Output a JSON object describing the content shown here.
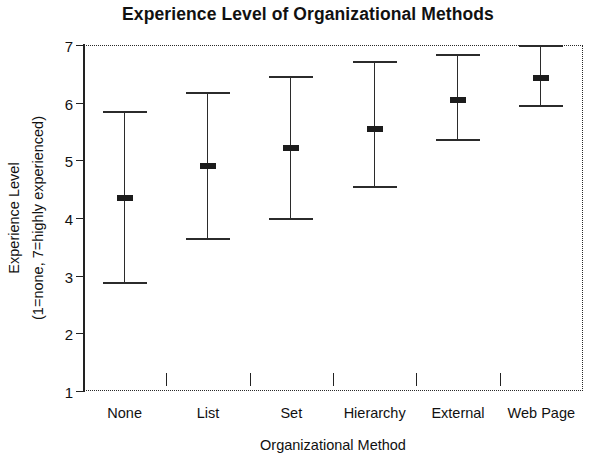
{
  "chart_data": {
    "type": "errorbar",
    "title": "Experience Level of Organizational Methods",
    "xlabel": "Organizational Method",
    "ylabel_line1": "Experience Level",
    "ylabel_line2": "(1=none, 7=highly experienced)",
    "categories": [
      "None",
      "List",
      "Set",
      "Hierarchy",
      "External",
      "Web Page"
    ],
    "means": [
      4.35,
      4.9,
      5.22,
      5.55,
      6.05,
      6.42
    ],
    "lower": [
      2.85,
      3.62,
      3.96,
      4.52,
      5.33,
      5.93
    ],
    "upper": [
      5.85,
      6.18,
      6.47,
      6.73,
      6.85,
      7.0
    ],
    "ylim": [
      1,
      7
    ],
    "yticks": [
      1,
      2,
      3,
      4,
      5,
      6,
      7
    ],
    "ytick_labels": [
      "1",
      "2",
      "3",
      "4",
      "5",
      "6",
      "7"
    ],
    "grid": false,
    "legend": null,
    "marker_color": "#1c1c1c",
    "line_color": "#2b2b2b",
    "axis_color": "#222222",
    "background": "#ffffff"
  }
}
